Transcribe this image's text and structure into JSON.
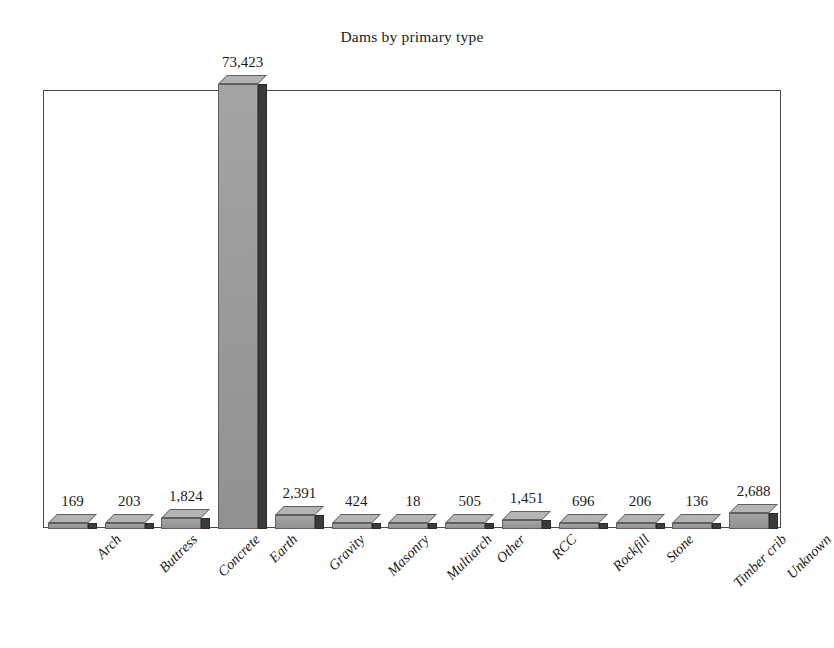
{
  "chart_data": {
    "type": "bar",
    "title": "Dams by primary type",
    "xlabel": "",
    "ylabel": "",
    "grid": false,
    "legend": "none",
    "ylim": [
      0,
      78000
    ],
    "axis_tick_labels": [],
    "style": {
      "bar_face_color": "#9a9a9a",
      "bar_side_color": "#3b3b3b",
      "bar_top_color": "#b4b4b4",
      "frame_color": "#4a4a4a",
      "background": "#ffffff",
      "text_color": "#1d1d1d",
      "three_d": true,
      "label_rotation_degrees": -45
    },
    "categories": [
      "Arch",
      "Buttress",
      "Concrete",
      "Earth",
      "Gravity",
      "Masonry",
      "Multiarch",
      "Other",
      "RCC",
      "Rockfill",
      "Stone",
      "Timber crib",
      "Unknown"
    ],
    "values": [
      169,
      203,
      1824,
      73423,
      2391,
      424,
      18,
      505,
      1451,
      696,
      206,
      136,
      2688
    ],
    "value_labels": [
      "169",
      "203",
      "1,824",
      "73,423",
      "2,391",
      "424",
      "18",
      "505",
      "1,451",
      "696",
      "206",
      "136",
      "2,688"
    ]
  }
}
